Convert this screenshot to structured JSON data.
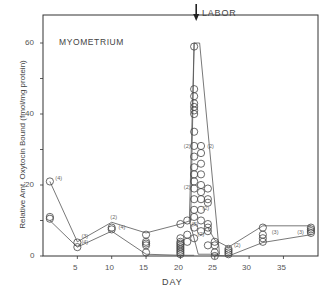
{
  "chart_data": {
    "type": "scatter",
    "title": "MYOMETRIUM",
    "annotation": "LABOR",
    "annotation_day": 22.3,
    "xlabel": "DAY",
    "ylabel": "Relative Amt. Oxytocin Bound (fmol/mg protein)",
    "xlim": [
      0,
      40
    ],
    "ylim": [
      0,
      68
    ],
    "xticks": [
      5,
      10,
      15,
      20,
      25,
      30,
      35
    ],
    "yticks": [
      0,
      20,
      40,
      60
    ],
    "grid": false,
    "series": [
      {
        "name": "individual measurements",
        "points": [
          [
            1,
            21
          ],
          [
            1,
            11
          ],
          [
            1,
            10.5
          ],
          [
            5,
            3.8
          ],
          [
            5,
            2.5
          ],
          [
            10,
            8
          ],
          [
            10,
            7.5
          ],
          [
            15,
            6
          ],
          [
            15,
            4
          ],
          [
            15,
            3.5
          ],
          [
            15,
            3
          ],
          [
            15,
            1
          ],
          [
            20,
            9
          ],
          [
            20,
            5
          ],
          [
            20,
            4
          ],
          [
            20,
            3.5
          ],
          [
            20,
            3
          ],
          [
            20,
            2.5
          ],
          [
            20,
            2
          ],
          [
            20,
            1.5
          ],
          [
            20,
            1
          ],
          [
            20,
            0.5
          ],
          [
            21,
            10
          ],
          [
            21,
            6
          ],
          [
            21,
            4
          ],
          [
            22,
            59
          ],
          [
            22,
            47
          ],
          [
            22,
            45
          ],
          [
            22,
            43
          ],
          [
            22,
            42
          ],
          [
            22,
            41
          ],
          [
            22,
            40
          ],
          [
            22,
            35
          ],
          [
            22,
            31
          ],
          [
            22,
            28
          ],
          [
            22,
            25
          ],
          [
            22,
            23
          ],
          [
            22,
            21
          ],
          [
            22,
            19
          ],
          [
            22,
            16
          ],
          [
            22,
            13
          ],
          [
            22,
            11
          ],
          [
            22,
            8
          ],
          [
            22,
            5
          ],
          [
            23,
            31
          ],
          [
            23,
            29
          ],
          [
            23,
            26
          ],
          [
            23,
            23
          ],
          [
            23,
            20
          ],
          [
            23,
            18
          ],
          [
            23,
            16
          ],
          [
            23,
            13
          ],
          [
            23,
            10
          ],
          [
            23,
            7
          ],
          [
            24,
            19
          ],
          [
            24,
            16
          ],
          [
            24,
            15
          ],
          [
            24,
            9
          ],
          [
            24,
            8
          ],
          [
            24,
            7
          ],
          [
            24,
            3
          ],
          [
            25,
            4
          ],
          [
            25,
            3
          ],
          [
            25,
            1
          ],
          [
            25,
            0
          ],
          [
            27,
            2
          ],
          [
            27,
            1.5
          ],
          [
            27,
            1
          ],
          [
            27,
            0.5
          ],
          [
            32,
            8
          ],
          [
            32,
            6
          ],
          [
            32,
            5
          ],
          [
            32,
            4
          ],
          [
            39,
            8
          ],
          [
            39,
            7.5
          ],
          [
            39,
            7
          ],
          [
            39,
            6.5
          ]
        ]
      }
    ],
    "envelope_upper": [
      [
        1,
        21
      ],
      [
        5,
        4
      ],
      [
        10,
        9.5
      ],
      [
        15,
        6.5
      ],
      [
        20,
        9
      ],
      [
        21.5,
        10
      ],
      [
        22,
        60
      ]
    ],
    "envelope_lower": [
      [
        1,
        10
      ],
      [
        5,
        2.5
      ],
      [
        10,
        7
      ],
      [
        15,
        0.5
      ],
      [
        20,
        0.2
      ],
      [
        22,
        0.2
      ]
    ],
    "peak_wedge": [
      [
        21.3,
        10
      ],
      [
        22,
        60
      ],
      [
        22.8,
        60
      ],
      [
        25.7,
        0.5
      ],
      [
        22.6,
        0.5
      ]
    ],
    "right_upper": [
      [
        24,
        8
      ],
      [
        25,
        4.5
      ],
      [
        27,
        2.5
      ],
      [
        32,
        8.5
      ],
      [
        39,
        8.5
      ]
    ],
    "right_lower": [
      [
        25,
        0.2
      ],
      [
        27,
        0
      ],
      [
        32,
        3.8
      ],
      [
        39,
        6
      ]
    ],
    "n_labels": [
      {
        "day": 1.8,
        "value": 21.5,
        "text": "(4)"
      },
      {
        "day": 5.6,
        "value": 5.2,
        "text": "(3)"
      },
      {
        "day": 5.6,
        "value": 3.5,
        "text": "(4)"
      },
      {
        "day": 9.8,
        "value": 10.5,
        "text": "(2)"
      },
      {
        "day": 11,
        "value": 7.5,
        "text": "(4)"
      },
      {
        "day": 20.5,
        "value": 30.5,
        "text": "(2)"
      },
      {
        "day": 23.9,
        "value": 30.5,
        "text": "(2)"
      },
      {
        "day": 20.5,
        "value": 19,
        "text": "(2)"
      },
      {
        "day": 23.2,
        "value": 13,
        "text": "(2)"
      },
      {
        "day": 22.5,
        "value": 5.5,
        "text": "(2)"
      },
      {
        "day": 21.6,
        "value": 8.5,
        "text": "(5)"
      },
      {
        "day": 27.8,
        "value": 2.5,
        "text": "(2)"
      },
      {
        "day": 33.3,
        "value": 6.3,
        "text": "(3)"
      },
      {
        "day": 37,
        "value": 6.3,
        "text": "(3)"
      }
    ]
  },
  "labels": {
    "title": "MYOMETRIUM",
    "annotation": "LABOR",
    "xlabel": "DAY",
    "ylabel": "Relative Amt. Oxytocin Bound (fmol/mg protein)",
    "xticks": [
      "5",
      "10",
      "15",
      "20",
      "25",
      "30",
      "35"
    ],
    "yticks": [
      "0",
      "20",
      "40",
      "60"
    ]
  }
}
